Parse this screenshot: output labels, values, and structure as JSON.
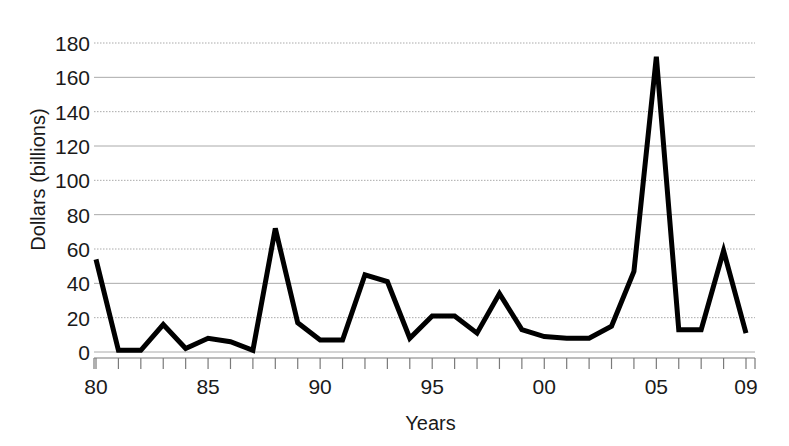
{
  "chart_data": {
    "type": "line",
    "title": "",
    "xlabel": "Years",
    "ylabel": "Dollars (billions)",
    "x": [
      1980,
      1981,
      1982,
      1983,
      1984,
      1985,
      1986,
      1987,
      1988,
      1989,
      1990,
      1991,
      1992,
      1993,
      1994,
      1995,
      1996,
      1997,
      1998,
      1999,
      2000,
      2001,
      2002,
      2003,
      2004,
      2005,
      2006,
      2007,
      2008,
      2009
    ],
    "x_tick_labels": [
      "80",
      "85",
      "90",
      "95",
      "00",
      "05",
      "09"
    ],
    "x_tick_values": [
      1980,
      1985,
      1990,
      1995,
      2000,
      2005,
      2009
    ],
    "xlim": [
      1980,
      2009
    ],
    "values": [
      54,
      1,
      1,
      16,
      2,
      8,
      6,
      1,
      72,
      17,
      7,
      7,
      45,
      41,
      8,
      21,
      21,
      11,
      34,
      13,
      9,
      8,
      8,
      15,
      47,
      172,
      13,
      13,
      59,
      11
    ],
    "ylim": [
      0,
      180
    ],
    "y_ticks": [
      0,
      20,
      40,
      60,
      80,
      100,
      120,
      140,
      160,
      180
    ],
    "y_tick_labels": [
      "0",
      "20",
      "40",
      "60",
      "80",
      "100",
      "120",
      "140",
      "160",
      "180"
    ],
    "grid": true,
    "grid_axis": "y",
    "legend": false,
    "series": [
      {
        "name": "Dollars (billions)",
        "color": "#000000",
        "line_width": 5,
        "values": [
          54,
          1,
          1,
          16,
          2,
          8,
          6,
          1,
          72,
          17,
          7,
          7,
          45,
          41,
          8,
          21,
          21,
          11,
          34,
          13,
          9,
          8,
          8,
          15,
          47,
          172,
          13,
          13,
          59,
          11
        ]
      }
    ],
    "colors": {
      "line": "#000000",
      "grid": "#aaaaaa",
      "axis": "#7a7a7a",
      "text": "#1a1a1a",
      "background": "#ffffff"
    }
  }
}
